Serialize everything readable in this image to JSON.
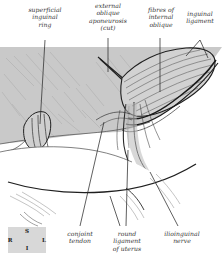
{
  "figure": {
    "background_color": "#ffffff",
    "tissue_color": "#c9c9c9",
    "ink_color": "#2b2b2b"
  },
  "labels": {
    "top": [
      {
        "id": "superficial-inguinal-ring",
        "text": "superficial\ninguinal\nring",
        "x": 18,
        "y": 6,
        "width": 54
      },
      {
        "id": "external-oblique-aponeurosis",
        "text": "external\noblique\naponeurosis\n(cut)",
        "x": 80,
        "y": 2,
        "width": 56
      },
      {
        "id": "fibres-of-internal-oblique",
        "text": "fibres of\ninternal\noblique",
        "x": 141,
        "y": 6,
        "width": 40
      },
      {
        "id": "inguinal-ligament",
        "text": "inguinal\nligament",
        "x": 179,
        "y": 10,
        "width": 42
      }
    ],
    "bottom": [
      {
        "id": "conjoint-tendon",
        "text": "conjoint\ntendon",
        "x": 58,
        "y": 230,
        "width": 44
      },
      {
        "id": "round-ligament-of-uterus",
        "text": "round\nligament\nof uterus",
        "x": 104,
        "y": 230,
        "width": 46
      },
      {
        "id": "ilioinguinal-nerve",
        "text": "ilioinguinal\nnerve",
        "x": 156,
        "y": 230,
        "width": 52
      }
    ]
  },
  "compass": {
    "box": {
      "x": 8,
      "y": 227,
      "width": 38,
      "height": 26
    },
    "superior": "S",
    "inferior": "I",
    "right": "R",
    "left": "L"
  }
}
